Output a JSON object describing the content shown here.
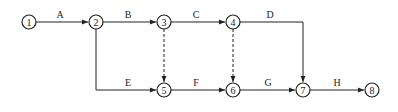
{
  "diagram": {
    "type": "activity-on-arrow network",
    "nodes": [
      {
        "id": "1",
        "label": "1",
        "x": 29,
        "y": 22
      },
      {
        "id": "2",
        "label": "2",
        "x": 96,
        "y": 22
      },
      {
        "id": "3",
        "label": "3",
        "x": 164,
        "y": 22
      },
      {
        "id": "4",
        "label": "4",
        "x": 233,
        "y": 22
      },
      {
        "id": "5",
        "label": "5",
        "x": 164,
        "y": 90
      },
      {
        "id": "6",
        "label": "6",
        "x": 233,
        "y": 90
      },
      {
        "id": "7",
        "label": "7",
        "x": 303,
        "y": 90
      },
      {
        "id": "8",
        "label": "8",
        "x": 372,
        "y": 90
      }
    ],
    "activities": [
      {
        "label": "A",
        "from": "1",
        "to": "2",
        "dashed": false
      },
      {
        "label": "B",
        "from": "2",
        "to": "3",
        "dashed": false
      },
      {
        "label": "C",
        "from": "3",
        "to": "4",
        "dashed": false
      },
      {
        "label": "D",
        "from": "4",
        "to": "7",
        "dashed": false
      },
      {
        "label": "E",
        "from": "2",
        "to": "5",
        "dashed": false
      },
      {
        "label": "F",
        "from": "5",
        "to": "6",
        "dashed": false
      },
      {
        "label": "G",
        "from": "6",
        "to": "7",
        "dashed": false
      },
      {
        "label": "H",
        "from": "7",
        "to": "8",
        "dashed": false
      },
      {
        "label": "",
        "from": "3",
        "to": "5",
        "dashed": true
      },
      {
        "label": "",
        "from": "4",
        "to": "6",
        "dashed": true
      }
    ]
  },
  "labels": {
    "A": "A",
    "B": "B",
    "C": "C",
    "D": "D",
    "E": "E",
    "F": "F",
    "G": "G",
    "H": "H"
  },
  "node_labels": {
    "n1": "1",
    "n2": "2",
    "n3": "3",
    "n4": "4",
    "n5": "5",
    "n6": "6",
    "n7": "7",
    "n8": "8"
  }
}
